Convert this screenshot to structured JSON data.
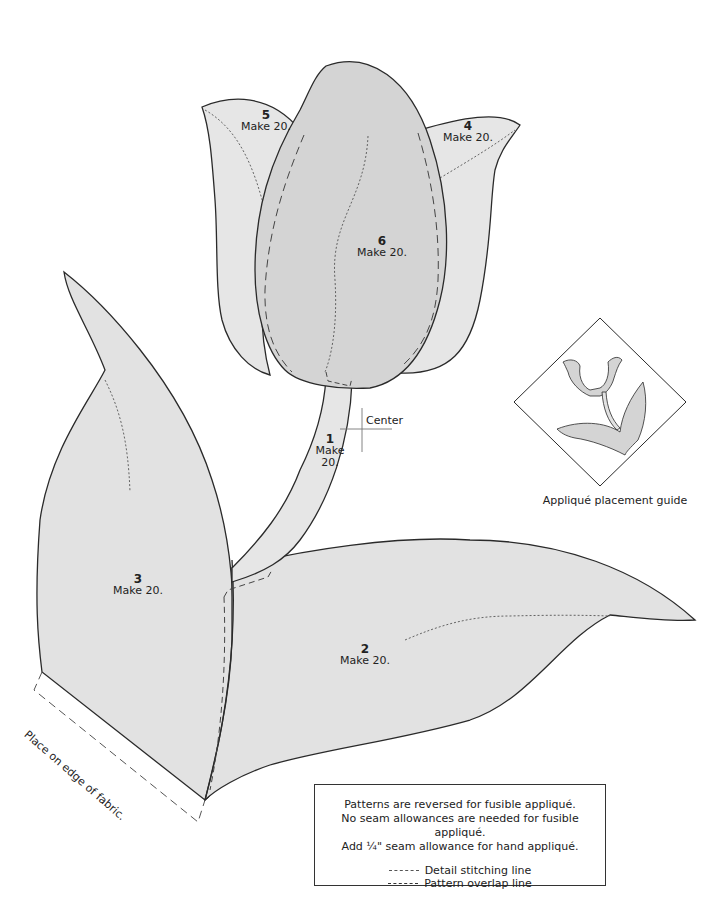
{
  "pieces": [
    {
      "id": "piece-1",
      "number": "1",
      "make": "Make",
      "make2": "20.",
      "name": "stem"
    },
    {
      "id": "piece-2",
      "number": "2",
      "make": "Make 20.",
      "name": "lower-right-leaf"
    },
    {
      "id": "piece-3",
      "number": "3",
      "make": "Make 20.",
      "name": "left-leaf"
    },
    {
      "id": "piece-4",
      "number": "4",
      "make": "Make 20.",
      "name": "right-petal"
    },
    {
      "id": "piece-5",
      "number": "5",
      "make": "Make 20.",
      "name": "left-petal"
    },
    {
      "id": "piece-6",
      "number": "6",
      "make": "Make 20.",
      "name": "center-petal"
    }
  ],
  "labels": {
    "center": "Center",
    "edge_of_fabric": "Place on edge of fabric.",
    "placement_guide": "Appliqué placement guide"
  },
  "notes": {
    "line1": "Patterns are reversed for fusible appliqué.",
    "line2": "No seam allowances are needed for fusible appliqué.",
    "line3": "Add ¼\" seam allowance for hand appliqué.",
    "legend": [
      {
        "style": "dotted",
        "label": "Detail stitching line"
      },
      {
        "style": "dashed",
        "label": "Pattern overlap line"
      }
    ]
  },
  "colors": {
    "fill_light": "#e4e4e4",
    "fill_mid": "#d3d3d3",
    "outline": "#2a2a2a",
    "background": "#ffffff"
  }
}
